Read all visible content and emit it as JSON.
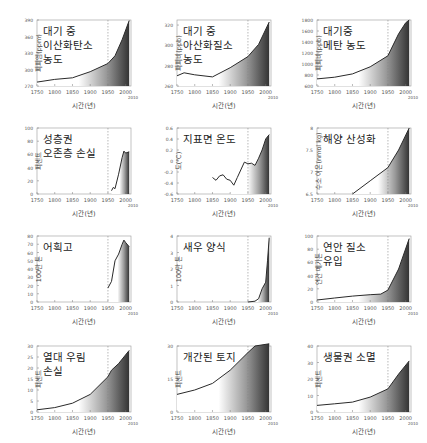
{
  "chart_data": [
    {
      "id": "co2",
      "type": "area",
      "title": "대기 중\n이산화탄소\n농도",
      "ylabel": "피피엠(ppm)",
      "xlabel": "시간(년)",
      "yticks": [
        270,
        300,
        330,
        360,
        390
      ],
      "ylim": [
        270,
        390
      ],
      "xlim": [
        1750,
        2010
      ],
      "x": [
        1750,
        1800,
        1850,
        1900,
        1950,
        1970,
        1990,
        2010
      ],
      "values": [
        277,
        282,
        285,
        296,
        311,
        325,
        354,
        389
      ]
    },
    {
      "id": "n2o",
      "type": "area",
      "title": "대기 중\n아산화질소\n농도",
      "ylabel": "피피비(ppb)",
      "xlabel": "시간(년)",
      "yticks": [
        260,
        280,
        300,
        320
      ],
      "ylim": [
        260,
        325
      ],
      "xlim": [
        1750,
        2010
      ],
      "x": [
        1750,
        1770,
        1800,
        1850,
        1900,
        1950,
        1980,
        2010
      ],
      "values": [
        270,
        273,
        271,
        269,
        278,
        289,
        301,
        323
      ]
    },
    {
      "id": "ch4",
      "type": "area",
      "title": "대기중\n메탄 농도",
      "ylabel": "피피비(ppb)",
      "xlabel": "시간(년)",
      "yticks": [
        600,
        800,
        1000,
        1200,
        1400,
        1600,
        1800
      ],
      "ylim": [
        600,
        1800
      ],
      "xlim": [
        1750,
        2010
      ],
      "x": [
        1750,
        1800,
        1850,
        1900,
        1950,
        1980,
        2000,
        2010
      ],
      "values": [
        730,
        760,
        820,
        950,
        1150,
        1550,
        1750,
        1800
      ]
    },
    {
      "id": "ozone",
      "type": "area",
      "title": "성층권\n오존층 손실",
      "ylabel": "퍼센트",
      "xlabel": "시간(년)",
      "yticks": [
        0,
        20,
        40,
        60,
        80,
        100
      ],
      "ylim": [
        0,
        100
      ],
      "xlim": [
        1750,
        2010
      ],
      "x": [
        1960,
        1965,
        1970,
        1980,
        1990,
        1995,
        2000,
        2010
      ],
      "values": [
        5,
        10,
        8,
        30,
        55,
        65,
        62,
        64
      ]
    },
    {
      "id": "temp",
      "type": "line",
      "title": "지표면 온도",
      "ylabel": "도(℃)",
      "xlabel": "시간(년)",
      "yticks": [
        -0.6,
        -0.4,
        -0.2,
        0,
        0.2,
        0.4,
        0.6
      ],
      "ylim": [
        -0.6,
        0.6
      ],
      "xlim": [
        1750,
        2010
      ],
      "x": [
        1850,
        1860,
        1870,
        1880,
        1890,
        1900,
        1910,
        1920,
        1940,
        1950,
        1960,
        1970,
        1980,
        1990,
        2000,
        2010
      ],
      "values": [
        -0.3,
        -0.35,
        -0.27,
        -0.25,
        -0.33,
        -0.35,
        -0.44,
        -0.3,
        -0.02,
        -0.05,
        -0.04,
        -0.08,
        0.05,
        0.2,
        0.4,
        0.48
      ]
    },
    {
      "id": "ocean",
      "type": "area",
      "title": "해양 산성화",
      "ylabel": "수소 이온(nmol kg)",
      "xlabel": "시간(년)",
      "yticks": [
        6.5,
        7.0,
        7.5,
        8.0
      ],
      "ylim": [
        6.5,
        8.0
      ],
      "xlim": [
        1750,
        2010
      ],
      "x": [
        1850,
        1900,
        1950,
        1980,
        2010
      ],
      "values": [
        6.5,
        6.8,
        7.1,
        7.5,
        8.0
      ]
    },
    {
      "id": "fish",
      "type": "area",
      "title": "어획고",
      "ylabel": "100만 톤",
      "xlabel": "시간(년)",
      "yticks": [
        0,
        10,
        20,
        30,
        40,
        50,
        60,
        70,
        80
      ],
      "ylim": [
        0,
        80
      ],
      "xlim": [
        1750,
        2010
      ],
      "x": [
        1950,
        1960,
        1970,
        1980,
        1990,
        1995,
        2000,
        2010
      ],
      "values": [
        17,
        25,
        50,
        58,
        70,
        75,
        72,
        67
      ]
    },
    {
      "id": "shrimp",
      "type": "area",
      "title": "새우 양식",
      "ylabel": "100만 톤",
      "xlabel": "시간(년)",
      "yticks": [
        0,
        1,
        2,
        3,
        4
      ],
      "ylim": [
        0,
        4
      ],
      "xlim": [
        1750,
        2010
      ],
      "x": [
        1950,
        1970,
        1980,
        1990,
        2000,
        2005,
        2010
      ],
      "values": [
        0,
        0.05,
        0.2,
        0.8,
        1.2,
        2.5,
        3.9
      ]
    },
    {
      "id": "nitrogen",
      "type": "area",
      "title": "연안 질소\n유입",
      "ylabel": "연간 메가톤",
      "xlabel": "시간(년)",
      "yticks": [
        0,
        20,
        40,
        60,
        80,
        100
      ],
      "ylim": [
        0,
        100
      ],
      "xlim": [
        1750,
        2010
      ],
      "x": [
        1750,
        1800,
        1850,
        1900,
        1930,
        1950,
        1980,
        2010
      ],
      "values": [
        3,
        6,
        9,
        11,
        12,
        18,
        50,
        96
      ]
    },
    {
      "id": "forest",
      "type": "area",
      "title": "열대 우림\n손실",
      "ylabel": "퍼센트",
      "xlabel": "시간(년)",
      "yticks": [
        0,
        5,
        10,
        15,
        20,
        25,
        30
      ],
      "ylim": [
        0,
        30
      ],
      "xlim": [
        1750,
        2010
      ],
      "x": [
        1750,
        1800,
        1850,
        1900,
        1950,
        1960,
        1980,
        2010
      ],
      "values": [
        1,
        2,
        4,
        8,
        16,
        19,
        22,
        28
      ]
    },
    {
      "id": "land",
      "type": "area",
      "title": "개간된 토지",
      "ylabel": "퍼센트",
      "xlabel": "시간(년)",
      "yticks": [
        0,
        15,
        30
      ],
      "ylim": [
        0,
        30
      ],
      "xlim": [
        1750,
        2010
      ],
      "x": [
        1750,
        1800,
        1850,
        1900,
        1950,
        1970,
        2010
      ],
      "values": [
        8,
        10,
        13,
        19,
        27,
        30,
        31
      ]
    },
    {
      "id": "biosphere",
      "type": "area",
      "title": "생물권 소멸",
      "ylabel": "퍼센트",
      "xlabel": "시간(년)",
      "yticks": [
        0,
        10,
        20,
        30,
        40
      ],
      "ylim": [
        0,
        40
      ],
      "xlim": [
        1750,
        2010
      ],
      "x": [
        1750,
        1800,
        1850,
        1900,
        1950,
        1980,
        2010
      ],
      "values": [
        4,
        5,
        6,
        9,
        14,
        23,
        31
      ]
    }
  ],
  "xaxis": {
    "ticks": [
      "1750",
      "1800",
      "1850",
      "1900",
      "1950",
      "2000"
    ],
    "end_label": "2010",
    "marker_year": 1950
  },
  "colors": {
    "line": "#2a2a2a",
    "fill_dark": "#3a3a3a",
    "fill_light": "#ffffff",
    "marker": "#888888"
  }
}
